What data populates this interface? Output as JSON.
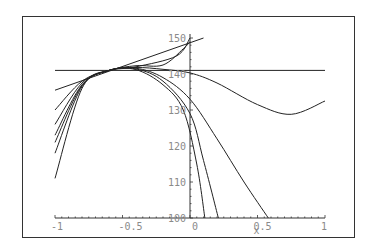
{
  "chart_data": {
    "type": "line",
    "title": "",
    "xlabel": "x",
    "ylabel": "",
    "xlim": [
      -1,
      1
    ],
    "ylim": [
      100,
      150
    ],
    "grid": false,
    "legend": null,
    "x_ticks": [
      "-1",
      "-0.5",
      "0",
      "0.5",
      "1"
    ],
    "y_ticks": [
      "100",
      "110",
      "120",
      "130",
      "140",
      "150"
    ],
    "series": [
      {
        "name": "horizontal",
        "points": [
          [
            -1,
            141
          ],
          [
            1,
            141
          ]
        ]
      },
      {
        "name": "tangent-line",
        "points": [
          [
            -1,
            135.5
          ],
          [
            0.1,
            150
          ]
        ]
      },
      {
        "name": "poly-a",
        "points": [
          [
            -1,
            130
          ],
          [
            -0.8,
            138
          ],
          [
            -0.6,
            141
          ],
          [
            -0.4,
            142
          ],
          [
            -0.1,
            145
          ],
          [
            0,
            150
          ]
        ]
      },
      {
        "name": "poly-b",
        "points": [
          [
            -1,
            126
          ],
          [
            -0.8,
            137.5
          ],
          [
            -0.6,
            141
          ],
          [
            -0.4,
            142.3
          ],
          [
            -0.2,
            142.5
          ],
          [
            -0.05,
            147
          ],
          [
            0,
            149
          ]
        ]
      },
      {
        "name": "poly-c-wave",
        "points": [
          [
            -1,
            123
          ],
          [
            -0.8,
            137
          ],
          [
            -0.6,
            141
          ],
          [
            -0.4,
            141.8
          ],
          [
            -0.2,
            141.3
          ],
          [
            0,
            140.3
          ],
          [
            0.2,
            137.5
          ],
          [
            0.5,
            131.5
          ],
          [
            0.75,
            128.8
          ],
          [
            1,
            132.5
          ]
        ]
      },
      {
        "name": "poly-d",
        "points": [
          [
            -1,
            121
          ],
          [
            -0.8,
            136.8
          ],
          [
            -0.6,
            141
          ],
          [
            -0.4,
            141.6
          ],
          [
            -0.2,
            139
          ],
          [
            0,
            133
          ],
          [
            0.2,
            122
          ],
          [
            0.4,
            110
          ],
          [
            0.58,
            100
          ]
        ]
      },
      {
        "name": "poly-e",
        "points": [
          [
            -1,
            118
          ],
          [
            -0.8,
            136.5
          ],
          [
            -0.6,
            141
          ],
          [
            -0.4,
            141.4
          ],
          [
            -0.2,
            138
          ],
          [
            0,
            129
          ],
          [
            0.1,
            116
          ],
          [
            0.21,
            100
          ]
        ]
      },
      {
        "name": "function",
        "points": [
          [
            -1,
            111
          ],
          [
            -0.8,
            136
          ],
          [
            -0.6,
            141
          ],
          [
            -0.4,
            141.2
          ],
          [
            -0.2,
            137
          ],
          [
            -0.05,
            130
          ],
          [
            0.05,
            115
          ],
          [
            0.11,
            100
          ]
        ]
      }
    ]
  }
}
